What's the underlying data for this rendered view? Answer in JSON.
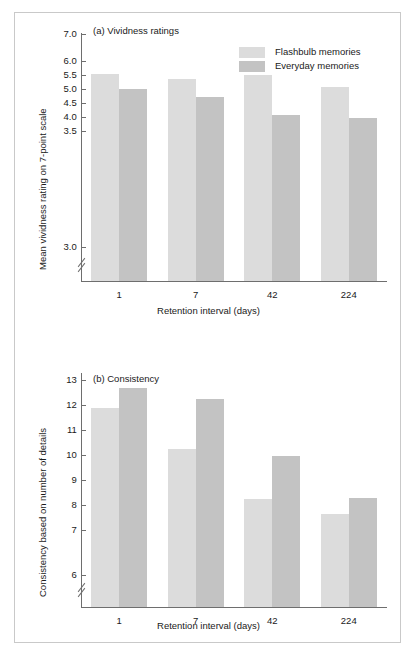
{
  "figure": {
    "legend": {
      "entries": [
        {
          "label": "Flashbulb memories",
          "color": "#dcdcdc",
          "swatch": "legend-swatch-flashbulb"
        },
        {
          "label": "Everyday memories",
          "color": "#c3c3c3",
          "swatch": "legend-swatch-everyday"
        }
      ]
    },
    "colors": {
      "flashbulb": "#dcdcdc",
      "everyday": "#c3c3c3",
      "axis": "#6e6e6e",
      "frame": "#c9c9c9",
      "text": "#1a1a1a",
      "background": "#ffffff"
    }
  },
  "chart_data": [
    {
      "type": "bar",
      "id": "panel-a",
      "title": "(a) Vividness ratings",
      "xlabel": "Retention interval (days)",
      "ylabel": "Mean vividness rating on 7-point scale",
      "categories": [
        "1",
        "7",
        "42",
        "224"
      ],
      "series": [
        {
          "name": "Flashbulb memories",
          "color": "#dcdcdc",
          "values": [
            5.52,
            5.36,
            5.49,
            5.07
          ]
        },
        {
          "name": "Everyday memories",
          "color": "#c3c3c3",
          "values": [
            4.99,
            4.72,
            4.06,
            3.97
          ]
        }
      ],
      "yticks": [
        "7.0",
        "6.0",
        "5.5",
        "5.0",
        "4.5",
        "4.0",
        "3.5",
        "3.0"
      ],
      "ytick_values": [
        7.0,
        6.0,
        5.5,
        5.0,
        4.5,
        4.0,
        3.5,
        3.0
      ],
      "ylim": [
        3.0,
        7.0
      ],
      "axis_break": true,
      "axis_break_note": "y-axis broken below 3.0; 6.5 tick omitted",
      "grid": false,
      "legend_position": "top-right"
    },
    {
      "type": "bar",
      "id": "panel-b",
      "title": "(b) Consistency",
      "xlabel": "Retention interval (days)",
      "ylabel": "Consistency based on number of details",
      "categories": [
        "1",
        "7",
        "42",
        "224"
      ],
      "series": [
        {
          "name": "Flashbulb memories",
          "color": "#dcdcdc",
          "values": [
            11.9,
            10.25,
            8.25,
            7.65
          ]
        },
        {
          "name": "Everyday memories",
          "color": "#c3c3c3",
          "values": [
            12.7,
            12.25,
            9.97,
            8.3
          ]
        }
      ],
      "yticks": [
        "13",
        "12",
        "11",
        "10",
        "9",
        "8",
        "7",
        "6"
      ],
      "ytick_values": [
        13,
        12,
        11,
        10,
        9,
        8,
        7,
        6
      ],
      "ylim": [
        6,
        13
      ],
      "axis_break": true,
      "axis_break_note": "y-axis broken below 6",
      "grid": false,
      "legend_position": "none"
    }
  ]
}
